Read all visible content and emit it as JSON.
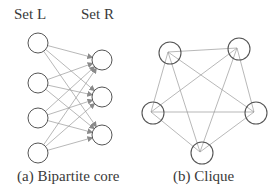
{
  "bipartite": {
    "set_left_label": "Set L",
    "set_right_label": "Set R",
    "caption": "(a) Bipartite core",
    "left_nodes": [
      [
        38,
        43
      ],
      [
        38,
        83
      ],
      [
        38,
        118
      ],
      [
        38,
        153
      ]
    ],
    "right_nodes": [
      [
        102,
        60
      ],
      [
        102,
        97
      ],
      [
        102,
        135
      ]
    ]
  },
  "clique": {
    "caption": "(b) Clique",
    "nodes": [
      [
        168,
        52
      ],
      [
        237,
        48
      ],
      [
        151,
        112
      ],
      [
        254,
        112
      ],
      [
        200,
        152
      ]
    ]
  },
  "colors": {
    "node_stroke": "#555555",
    "edge": "#9a9a9a",
    "text": "#3a3a3a"
  }
}
